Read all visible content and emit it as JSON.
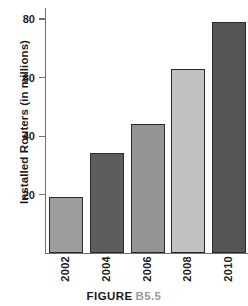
{
  "figure": {
    "caption_label": "FIGURE",
    "caption_number": "B5.5"
  },
  "chart_data": {
    "type": "bar",
    "title": "",
    "subtitle": "",
    "xlabel": "",
    "ylabel": "Installed Routers (in millions)",
    "categories": [
      "2002",
      "2004",
      "2006",
      "2008",
      "2010"
    ],
    "values": [
      19,
      34,
      44,
      63,
      79
    ],
    "series": [
      {
        "name": "Installed Routers",
        "values": [
          19,
          34,
          44,
          63,
          79
        ]
      }
    ],
    "ylim": [
      0,
      84
    ],
    "yticks": [
      20,
      40,
      60,
      80
    ],
    "ytick_labels": [
      "20",
      "40",
      "60",
      "80"
    ],
    "grid": false,
    "legend": false,
    "legend_position": "none",
    "bar_colors": [
      "#9d9d9d",
      "#5d5d5d",
      "#949494",
      "#c2c2c2",
      "#555555"
    ],
    "bar_edge_color": "#2b2b2b",
    "axis_color": "#6f6f6f",
    "label_rotation": 90,
    "annotations": []
  }
}
